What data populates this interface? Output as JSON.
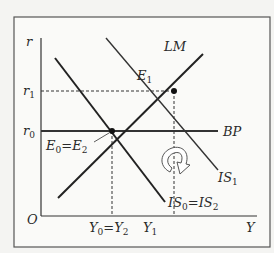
{
  "diagram": {
    "type": "IS-LM-BP economics diagram",
    "axes": {
      "y_label": "r",
      "x_label": "Y",
      "origin_label": "O"
    },
    "y_ticks": [
      {
        "base": "r",
        "sub": "1"
      },
      {
        "base": "r",
        "sub": "0"
      }
    ],
    "x_ticks": [
      {
        "text": "Y",
        "sub": "0",
        "eq": "=Y",
        "sub2": "2"
      },
      {
        "text": "Y",
        "sub": "1"
      }
    ],
    "curves": {
      "lm": "LM",
      "bp": "BP",
      "is1": {
        "base": "IS",
        "sub": "1"
      },
      "is0": {
        "base": "IS",
        "sub": "0",
        "eq": "=IS",
        "sub2": "2"
      }
    },
    "points": {
      "e1": {
        "base": "E",
        "sub": "1"
      },
      "e0": {
        "base": "E",
        "sub": "0",
        "eq": "=E",
        "sub2": "2"
      }
    },
    "colors": {
      "line": "#2a2a2a",
      "background": "#f4f4f2",
      "frame": "#555555"
    }
  }
}
